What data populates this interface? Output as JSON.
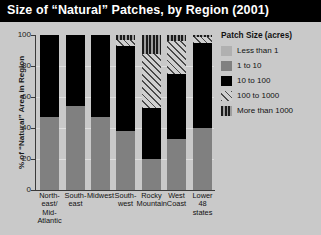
{
  "title": "Size of “Natural” Patches, by Region (2001)",
  "legend": {
    "title": "Patch Size (acres)",
    "items": [
      {
        "label": "Less than 1",
        "color": "#b0b0b0",
        "pattern": "solid-light-gray"
      },
      {
        "label": "1 to 10",
        "color": "#808080",
        "pattern": "solid-gray"
      },
      {
        "label": "10 to 100",
        "color": "#000000",
        "pattern": "solid-black"
      },
      {
        "label": "100 to 1000",
        "color": "#4a4a4a",
        "pattern": "diagonal-hatch"
      },
      {
        "label": "More than 1000",
        "color": "#1b1b1b",
        "pattern": "vertical-stripes"
      }
    ]
  },
  "axis": {
    "y_title": "% of “Natural” Area in Region",
    "y_ticks": [
      "100",
      "80",
      "60",
      "40",
      "20",
      "0"
    ]
  },
  "chart_data": {
    "type": "bar",
    "subtype": "stacked-100-percent",
    "title": "Size of “Natural” Patches, by Region (2001)",
    "xlabel": "",
    "ylabel": "% of “Natural” Area in Region",
    "ylim": [
      0,
      100
    ],
    "yticks": [
      0,
      20,
      40,
      60,
      80,
      100
    ],
    "grid": true,
    "legend_position": "right",
    "legend_title": "Patch Size (acres)",
    "categories": [
      "North-east/ Mid-Atlantic",
      "South-east",
      "Midwest",
      "South-west",
      "Rocky Mountain",
      "West Coast",
      "Lower 48 states"
    ],
    "series": [
      {
        "name": "Less than 1",
        "values": [
          0,
          0,
          0,
          0,
          0,
          0,
          0
        ]
      },
      {
        "name": "1 to 10",
        "values": [
          47,
          54,
          47,
          38,
          20,
          33,
          40
        ]
      },
      {
        "name": "10 to 100",
        "values": [
          53,
          46,
          53,
          55,
          33,
          42,
          55
        ]
      },
      {
        "name": "100 to 1000",
        "values": [
          0,
          0,
          0,
          4,
          35,
          21,
          4
        ]
      },
      {
        "name": "More than 1000",
        "values": [
          0,
          0,
          0,
          3,
          12,
          4,
          1
        ]
      }
    ]
  }
}
